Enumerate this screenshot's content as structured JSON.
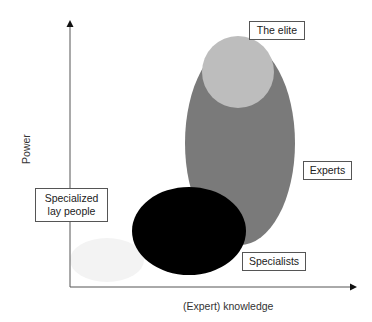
{
  "diagram": {
    "type": "set-overlap diagram",
    "axes": {
      "x_label": "(Expert) knowledge",
      "y_label": "Power"
    },
    "groups": [
      {
        "id": "lay",
        "label": "Specialized lay people",
        "color": "#f3f3f3"
      },
      {
        "id": "specialists",
        "label": "Specialists",
        "color": "#000000"
      },
      {
        "id": "experts",
        "label": "Experts",
        "color": "#7a7a7a"
      },
      {
        "id": "elite",
        "label": "The elite",
        "color": "#bdbdbd"
      }
    ]
  },
  "labels": {
    "elite": "The elite",
    "experts": "Experts",
    "specialists": "Specialists",
    "lay_line1": "Specialized",
    "lay_line2": "lay people"
  }
}
